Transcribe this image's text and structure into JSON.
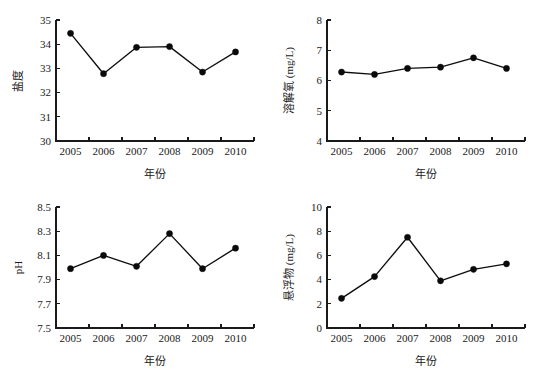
{
  "figure": {
    "background_color": "#ffffff",
    "line_color": "#0d0d0d",
    "marker_color": "#0a0a0a",
    "axis_color": "#1a1a1a"
  },
  "chart_data": [
    {
      "type": "line",
      "panel": "top-left",
      "title": "",
      "xlabel": "年份",
      "ylabel": "盐度",
      "categories": [
        "2005",
        "2006",
        "2007",
        "2008",
        "2009",
        "2010"
      ],
      "x": [
        2005,
        2006,
        2007,
        2008,
        2009,
        2010
      ],
      "values": [
        34.45,
        32.78,
        33.87,
        33.9,
        32.85,
        33.68
      ],
      "ylim": [
        30,
        35
      ],
      "yticks": [
        "30",
        "31",
        "32",
        "33",
        "34",
        "35"
      ],
      "ytick_values": [
        30,
        31,
        32,
        33,
        34,
        35
      ],
      "xticks": [
        "2005",
        "2006",
        "2007",
        "2008",
        "2009",
        "2010"
      ],
      "grid": false,
      "legend": "none",
      "marker": "filled-circle"
    },
    {
      "type": "line",
      "panel": "top-right",
      "title": "",
      "xlabel": "年份",
      "ylabel": "溶解氧 (mg/L)",
      "categories": [
        "2005",
        "2006",
        "2007",
        "2008",
        "2009",
        "2010"
      ],
      "x": [
        2005,
        2006,
        2007,
        2008,
        2009,
        2010
      ],
      "values": [
        6.28,
        6.2,
        6.4,
        6.44,
        6.75,
        6.4
      ],
      "ylim": [
        4,
        8
      ],
      "yticks": [
        "4",
        "5",
        "6",
        "7",
        "8"
      ],
      "ytick_values": [
        4,
        5,
        6,
        7,
        8
      ],
      "xticks": [
        "2005",
        "2006",
        "2007",
        "2008",
        "2009",
        "2010"
      ],
      "grid": false,
      "legend": "none",
      "marker": "filled-circle"
    },
    {
      "type": "line",
      "panel": "bottom-left",
      "title": "",
      "xlabel": "年份",
      "ylabel": "pH",
      "categories": [
        "2005",
        "2006",
        "2007",
        "2008",
        "2009",
        "2010"
      ],
      "x": [
        2005,
        2006,
        2007,
        2008,
        2009,
        2010
      ],
      "values": [
        7.99,
        8.1,
        8.01,
        8.28,
        7.99,
        8.16
      ],
      "ylim": [
        7.5,
        8.5
      ],
      "yticks": [
        "7.5",
        "7.7",
        "7.9",
        "8.1",
        "8.3",
        "8.5"
      ],
      "ytick_values": [
        7.5,
        7.7,
        7.9,
        8.1,
        8.3,
        8.5
      ],
      "xticks": [
        "2005",
        "2006",
        "2007",
        "2008",
        "2009",
        "2010"
      ],
      "grid": false,
      "legend": "none",
      "marker": "filled-circle"
    },
    {
      "type": "line",
      "panel": "bottom-right",
      "title": "",
      "xlabel": "年份",
      "ylabel": "悬浮物 (mg/L)",
      "categories": [
        "2005",
        "2006",
        "2007",
        "2008",
        "2009",
        "2010"
      ],
      "x": [
        2005,
        2006,
        2007,
        2008,
        2009,
        2010
      ],
      "values": [
        2.45,
        4.25,
        7.5,
        3.9,
        4.85,
        5.3
      ],
      "ylim": [
        0,
        10
      ],
      "yticks": [
        "0",
        "2",
        "4",
        "6",
        "8",
        "10"
      ],
      "ytick_values": [
        0,
        2,
        4,
        6,
        8,
        10
      ],
      "xticks": [
        "2005",
        "2006",
        "2007",
        "2008",
        "2009",
        "2010"
      ],
      "grid": false,
      "legend": "none",
      "marker": "filled-circle"
    }
  ]
}
